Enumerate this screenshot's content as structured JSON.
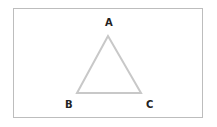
{
  "diagram": {
    "type": "triangle",
    "stroke_color": "#c8c8c8",
    "frame_color": "#bdbdbd",
    "vertices": [
      {
        "label": "A",
        "x": 108,
        "y": 35
      },
      {
        "label": "B",
        "x": 77,
        "y": 93
      },
      {
        "label": "C",
        "x": 141,
        "y": 93
      }
    ]
  }
}
